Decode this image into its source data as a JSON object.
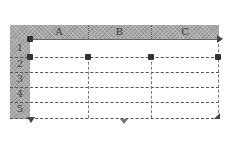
{
  "table": {
    "columns": [
      "A",
      "B",
      "C"
    ],
    "rows": [
      "1",
      "2",
      "3",
      "4",
      "5"
    ]
  },
  "colors": {
    "header_fill": "#a8a8a8",
    "grid_line": "#555555",
    "handle": "#333333"
  },
  "icons": {
    "resize_handle": "square-handle",
    "add_column_arrow": "arrow-right",
    "add_row_arrow": "arrow-down",
    "center_arrow": "triangle-down",
    "corner_arrow": "arrow-diagonal"
  }
}
